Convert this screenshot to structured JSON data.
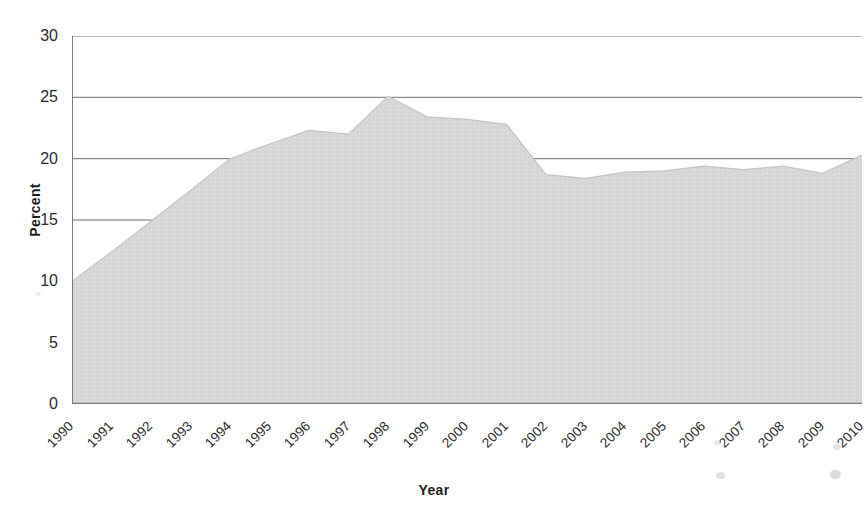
{
  "chart_data": {
    "type": "area",
    "title": "",
    "xlabel": "Year",
    "ylabel": "Percent",
    "categories": [
      "1990",
      "1991",
      "1992",
      "1993",
      "1994",
      "1995",
      "1996",
      "1997",
      "1998",
      "1999",
      "2000",
      "2001",
      "2002",
      "2003",
      "2004",
      "2005",
      "2006",
      "2007",
      "2008",
      "2009",
      "2010"
    ],
    "values": [
      10.0,
      12.4,
      14.9,
      17.4,
      20.0,
      21.2,
      22.3,
      22.0,
      25.1,
      23.4,
      23.2,
      22.8,
      18.7,
      18.4,
      18.9,
      19.0,
      19.4,
      19.1,
      19.4,
      18.8,
      20.3
    ],
    "series": [
      {
        "name": "Percent",
        "values": [
          10.0,
          12.4,
          14.9,
          17.4,
          20.0,
          21.2,
          22.3,
          22.0,
          25.1,
          23.4,
          23.2,
          22.8,
          18.7,
          18.4,
          18.9,
          19.0,
          19.4,
          19.1,
          19.4,
          18.8,
          20.3
        ]
      }
    ],
    "ylim": [
      0,
      30
    ],
    "yticks": [
      0,
      5,
      10,
      15,
      20,
      25,
      30
    ],
    "ytick_labels": [
      "0",
      "5",
      "10",
      "15",
      "20",
      "25",
      "30"
    ],
    "xlim": [
      "1990",
      "2010"
    ],
    "grid": "horizontal",
    "legend": "none",
    "fill_color": "#d6d6d6",
    "line_color": "#c4c4c4",
    "grid_color": "#6f6f6f",
    "axis_color": "#7a7a7a",
    "text_color": "#2b2b2b",
    "background": "#ffffff"
  },
  "axes": {
    "y_title": "Percent",
    "x_title": "Year"
  },
  "title_strip": {
    "text": ""
  }
}
